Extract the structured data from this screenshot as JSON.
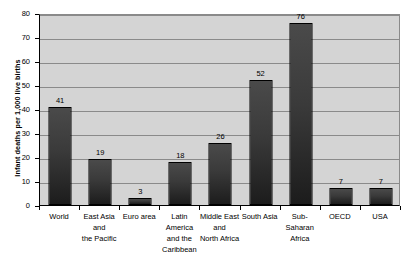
{
  "chart_data": {
    "type": "bar",
    "title": "",
    "subtitle": "",
    "xlabel": "",
    "ylabel": "Infant deaths per 1,000 live births",
    "ylim": [
      0,
      80
    ],
    "ytick_step": 10,
    "grid": true,
    "legend": false,
    "legend_position": "none",
    "categories": [
      "World",
      "East Asia and\nthe Pacific",
      "Euro area",
      "Latin America\nand the\nCaribbean",
      "Middle East\nand\nNorth Africa",
      "South Asia",
      "Sub-Saharan\nAfrica",
      "OECD",
      "USA"
    ],
    "values": [
      41,
      19,
      3,
      18,
      26,
      52,
      76,
      7,
      7
    ],
    "data_labels": [
      "41",
      "19",
      "3",
      "18",
      "26",
      "52",
      "76",
      "7",
      "7"
    ],
    "ytick_labels": [
      "0",
      "10",
      "20",
      "30",
      "40",
      "50",
      "60",
      "70",
      "80"
    ],
    "colors": {
      "bar_fill": "#3a3a3a",
      "bar_border": "#000000",
      "plot_background": "#d4d4d4",
      "gridline": "#8a8a8a",
      "axis": "#000000",
      "text": "#000000",
      "page_background": "#ffffff"
    }
  }
}
